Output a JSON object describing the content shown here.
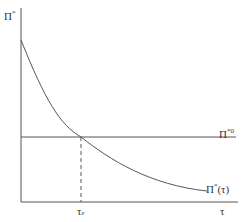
{
  "diagram": {
    "y_axis_label": "Π*",
    "x_axis_label": "τ",
    "horizontal_line_label": "Π*0",
    "curve_label": "Π*(τ)",
    "intersection_label": "τe",
    "colors": {
      "line": "#555555",
      "background": "#ffffff"
    }
  },
  "labels": {
    "y_axis": {
      "base": "Π",
      "sup": "*"
    },
    "hline": {
      "base": "Π",
      "sup": "*0"
    },
    "curve": {
      "base": "Π",
      "sup": "*",
      "tail": "(τ)"
    },
    "x_axis": "τ",
    "tau_e": {
      "base": "τ",
      "sub": "e"
    }
  }
}
